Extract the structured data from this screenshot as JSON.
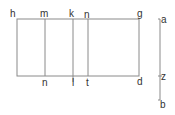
{
  "diagram": {
    "colors": {
      "line": "#8a8a8a",
      "text": "#333333",
      "background": "#ffffff"
    },
    "rectangle": {
      "top_labels": [
        "h",
        "m",
        "k",
        "n",
        "g"
      ],
      "bottom_labels": [
        "n",
        "l",
        "t",
        "d"
      ]
    },
    "segment": {
      "labels": [
        "a",
        "z",
        "b"
      ]
    }
  }
}
